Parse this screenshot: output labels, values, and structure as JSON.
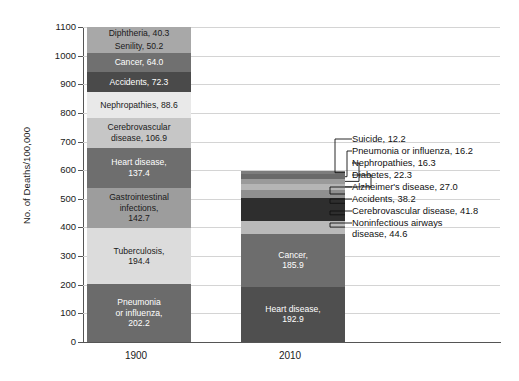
{
  "chart_data": {
    "type": "bar",
    "subtype": "stacked-bar",
    "title": "",
    "xlabel": "",
    "ylabel": "No. of Deaths/100,000",
    "ylim": [
      0,
      1100
    ],
    "ytick_values": [
      0,
      100,
      200,
      300,
      400,
      500,
      600,
      700,
      800,
      900,
      1000,
      1100
    ],
    "ytick_labels": [
      "0",
      "100",
      "200",
      "300",
      "400",
      "500",
      "600",
      "700",
      "800",
      "900",
      "1000",
      "1100"
    ],
    "grid": true,
    "legend": "none",
    "categories": [
      "1900",
      "2010"
    ],
    "series": [
      {
        "category": "1900",
        "total": 1098.8,
        "segments": [
          {
            "name": "Pneumonia or influenza",
            "value": 202.2,
            "label": "Pneumonia\nor influenza,\n202.2",
            "color": "#6b6b6b",
            "text_color": "#ffffff"
          },
          {
            "name": "Tuberculosis",
            "value": 194.4,
            "label": "Tuberculosis,\n194.4",
            "color": "#dcdcdc",
            "text_color": "#1a1a1a"
          },
          {
            "name": "Gastrointestinal infections",
            "value": 142.7,
            "label": "Gastrointestinal\ninfections,\n142.7",
            "color": "#9d9d9d",
            "text_color": "#1a1a1a"
          },
          {
            "name": "Heart disease",
            "value": 137.4,
            "label": "Heart disease,\n137.4",
            "color": "#6e6e6e",
            "text_color": "#ffffff"
          },
          {
            "name": "Cerebrovascular disease",
            "value": 106.9,
            "label": "Cerebrovascular\ndisease, 106.9",
            "color": "#c6c6c6",
            "text_color": "#1a1a1a"
          },
          {
            "name": "Nephropathies",
            "value": 88.6,
            "label": "Nephropathies, 88.6",
            "color": "#e9e9e9",
            "text_color": "#1a1a1a"
          },
          {
            "name": "Accidents",
            "value": 72.3,
            "label": "Accidents, 72.3",
            "color": "#4a4a4a",
            "text_color": "#ffffff"
          },
          {
            "name": "Cancer",
            "value": 64.0,
            "label": "Cancer, 64.0",
            "color": "#707070",
            "text_color": "#ffffff"
          },
          {
            "name": "Senility",
            "value": 50.2,
            "label": "Senility, 50.2",
            "color": "#a8a8a8",
            "text_color": "#1a1a1a"
          },
          {
            "name": "Diphtheria",
            "value": 40.3,
            "label": "Diphtheria, 40.3",
            "color": "#a8a8a8",
            "text_color": "#1a1a1a"
          }
        ]
      },
      {
        "category": "2010",
        "total": 596.4,
        "segments": [
          {
            "name": "Heart disease",
            "value": 192.9,
            "label": "Heart disease,\n192.9",
            "color": "#4f4f4f",
            "text_color": "#ffffff"
          },
          {
            "name": "Cancer",
            "value": 185.9,
            "label": "Cancer,\n185.9",
            "color": "#6d6d6d",
            "text_color": "#ffffff"
          },
          {
            "name": "Noninfectious airways disease",
            "value": 44.6,
            "label": "",
            "color": "#b9b9b9",
            "text_color": "#1a1a1a"
          },
          {
            "name": "Cerebrovascular disease",
            "value": 41.8,
            "label": "",
            "color": "#2e2e2e",
            "text_color": "#ffffff"
          },
          {
            "name": "Accidents",
            "value": 38.2,
            "label": "",
            "color": "#2e2e2e",
            "text_color": "#ffffff"
          },
          {
            "name": "Alzheimer's disease",
            "value": 27.0,
            "label": "",
            "color": "#8f8f8f",
            "text_color": "#1a1a1a"
          },
          {
            "name": "Diabetes",
            "value": 22.3,
            "label": "",
            "color": "#b5b5b5",
            "text_color": "#1a1a1a"
          },
          {
            "name": "Nephropathies",
            "value": 16.3,
            "label": "",
            "color": "#9a9a9a",
            "text_color": "#1a1a1a"
          },
          {
            "name": "Pneumonia or influenza",
            "value": 16.2,
            "label": "",
            "color": "#6a6a6a",
            "text_color": "#ffffff"
          },
          {
            "name": "Suicide",
            "value": 12.2,
            "label": "",
            "color": "#7d7d7d",
            "text_color": "#ffffff"
          }
        ]
      }
    ],
    "callouts": [
      {
        "text": "Suicide, 12.2",
        "value": 12.2
      },
      {
        "text": "Pneumonia or influenza, 16.2",
        "value": 16.2
      },
      {
        "text": "Nephropathies, 16.3",
        "value": 16.3
      },
      {
        "text": "Diabetes, 22.3",
        "value": 22.3
      },
      {
        "text": "Alzheimer's disease, 27.0",
        "value": 27.0
      },
      {
        "text": "Accidents, 38.2",
        "value": 38.2
      },
      {
        "text": "Cerebrovascular disease, 41.8",
        "value": 41.8
      },
      {
        "text": "Noninfectious airways\ndisease, 44.6",
        "value": 44.6
      }
    ]
  },
  "axes": {
    "y_title": "No. of Deaths/100,000",
    "y_ticks": [
      "1100",
      "1000",
      "900",
      "800",
      "700",
      "600",
      "500",
      "400",
      "300",
      "200",
      "100",
      "0"
    ],
    "x_ticks": [
      "1900",
      "2010"
    ]
  },
  "colors": {
    "grid": "#d4d4d4",
    "axis": "#555555",
    "background": "#ffffff",
    "text": "#1a1a1a"
  }
}
